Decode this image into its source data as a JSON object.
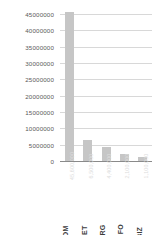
{
  "chart_data": {
    "type": "bar",
    "title": "",
    "subtitle": "",
    "xlabel": "",
    "ylabel": "",
    "categories": [
      "COM",
      ".NET",
      ".ORG",
      ".INFO",
      ".BIZ"
    ],
    "values": [
      45600000,
      6500000,
      4400000,
      2100000,
      1100000
    ],
    "value_labels": [
      "45,600,000",
      "6,500,000",
      "4,400,000",
      "2,100,000",
      "1,100,000"
    ],
    "series": [
      {
        "name": "Registered domains",
        "values": [
          45600000,
          6500000,
          4400000,
          2100000,
          1100000
        ]
      }
    ],
    "ylim": [
      0,
      45000000
    ],
    "y_ticks": [
      0,
      5000000,
      10000000,
      15000000,
      20000000,
      25000000,
      30000000,
      35000000,
      40000000,
      45000000
    ],
    "y_tick_labels": [
      "45000000",
      "40000000",
      "35000000",
      "30000000",
      "25000000",
      "20000000",
      "15000000",
      "10000000",
      "5000000",
      "0"
    ],
    "grid": true,
    "grid_axis": "y",
    "legend": false,
    "legend_position": "none",
    "orientation": "vertical",
    "bar_color": "#c6c6c6",
    "gridline_color": "#d8d8d8",
    "axis_color": "#8a8a8a",
    "tick_label_color": "#5a5a5a",
    "category_label_color": "#3d3d3d",
    "value_label_color": "#dddddd",
    "category_label_rotation": -90,
    "value_label_rotation": -90
  }
}
